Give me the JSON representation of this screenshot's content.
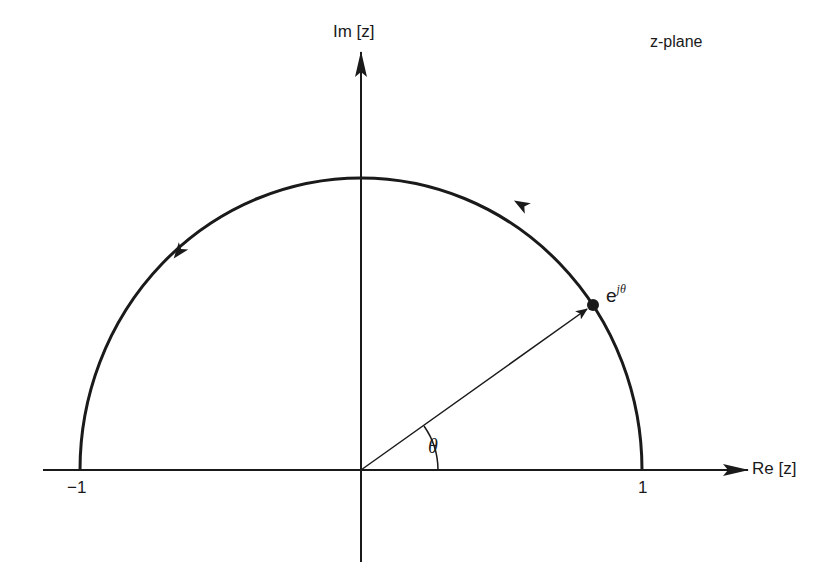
{
  "diagram": {
    "title": "z-plane",
    "axes": {
      "imag_label": "Im [z]",
      "real_label": "Re [z]"
    },
    "ticks": {
      "neg_one": "−1",
      "pos_one": "1"
    },
    "point": {
      "base": "e",
      "exponent": "jθ"
    },
    "angle_label": "θ",
    "colors": {
      "ink": "#1a1a1a",
      "background": "#ffffff"
    },
    "geometry": {
      "origin": [
        361,
        470
      ],
      "radius_x": 281,
      "radius_y": 292,
      "angle_deg": 35
    }
  }
}
